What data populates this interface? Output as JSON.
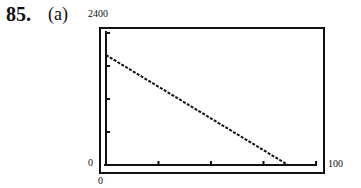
{
  "header": {
    "problem_number": "85.",
    "part": "(a)"
  },
  "axis_labels": {
    "ymax": "2400",
    "ymin": "0",
    "xmin": "0",
    "xmax": "100"
  },
  "colors": {
    "ink": "#111111",
    "background": "#ffffff"
  },
  "chart_data": {
    "type": "line",
    "title": "",
    "xlabel": "",
    "ylabel": "",
    "xlim": [
      0,
      100
    ],
    "ylim": [
      0,
      2400
    ],
    "x_tick_interval": 25,
    "y_tick_interval": 600,
    "grid": false,
    "legend": null,
    "series": [
      {
        "name": "line",
        "style": "dotted",
        "x": [
          0,
          86.7
        ],
        "y": [
          2000,
          0
        ]
      }
    ],
    "annotations": [
      "2400 (ymax)",
      "0 (ymin)",
      "0 (xmin)",
      "100 (xmax)"
    ]
  }
}
